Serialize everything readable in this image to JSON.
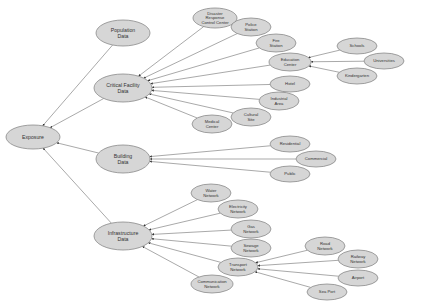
{
  "diagram": {
    "colors": {
      "node_fill": "#d6d6d6",
      "node_stroke": "#8a8a8a",
      "edge": "#6e6e6e",
      "text": "#333333"
    },
    "nodes": [
      {
        "id": "exposure",
        "lines": [
          "Exposure"
        ],
        "x": 33,
        "y": 137,
        "rx": 27,
        "ry": 12,
        "main": true
      },
      {
        "id": "population",
        "lines": [
          "Population",
          "Data"
        ],
        "x": 123,
        "y": 33,
        "rx": 27,
        "ry": 13,
        "main": true
      },
      {
        "id": "critical",
        "lines": [
          "Critical Facility",
          "Data"
        ],
        "x": 123,
        "y": 88,
        "rx": 29,
        "ry": 14,
        "main": true
      },
      {
        "id": "building",
        "lines": [
          "Building",
          "Data"
        ],
        "x": 123,
        "y": 159,
        "rx": 27,
        "ry": 14,
        "main": true
      },
      {
        "id": "infrastructure",
        "lines": [
          "Infrastructure",
          "Data"
        ],
        "x": 123,
        "y": 236,
        "rx": 29,
        "ry": 14,
        "main": true
      },
      {
        "id": "disaster",
        "lines": [
          "Disaster",
          "Response",
          "Control Center"
        ],
        "x": 215,
        "y": 18,
        "rx": 22,
        "ry": 10
      },
      {
        "id": "police",
        "lines": [
          "Police",
          "Station"
        ],
        "x": 251,
        "y": 27,
        "rx": 20,
        "ry": 9
      },
      {
        "id": "fire",
        "lines": [
          "Fire",
          "Station"
        ],
        "x": 276,
        "y": 43,
        "rx": 20,
        "ry": 9
      },
      {
        "id": "education",
        "lines": [
          "Education",
          "Center"
        ],
        "x": 290,
        "y": 62,
        "rx": 21,
        "ry": 9
      },
      {
        "id": "hotel",
        "lines": [
          "Hotel"
        ],
        "x": 290,
        "y": 84,
        "rx": 20,
        "ry": 8
      },
      {
        "id": "industrial",
        "lines": [
          "Industrial",
          "Area"
        ],
        "x": 279,
        "y": 101,
        "rx": 20,
        "ry": 9
      },
      {
        "id": "cultural",
        "lines": [
          "Cultural",
          "Site"
        ],
        "x": 251,
        "y": 117,
        "rx": 20,
        "ry": 9
      },
      {
        "id": "medical",
        "lines": [
          "Medical",
          "Center"
        ],
        "x": 212,
        "y": 124,
        "rx": 20,
        "ry": 9
      },
      {
        "id": "schools",
        "lines": [
          "Schools"
        ],
        "x": 357,
        "y": 46,
        "rx": 20,
        "ry": 8
      },
      {
        "id": "universities",
        "lines": [
          "Universities"
        ],
        "x": 384,
        "y": 61,
        "rx": 20,
        "ry": 8
      },
      {
        "id": "kindergarten",
        "lines": [
          "Kindergarten"
        ],
        "x": 357,
        "y": 76,
        "rx": 20,
        "ry": 8
      },
      {
        "id": "residential",
        "lines": [
          "Residential"
        ],
        "x": 290,
        "y": 144,
        "rx": 20,
        "ry": 8
      },
      {
        "id": "commercial",
        "lines": [
          "Commercial"
        ],
        "x": 316,
        "y": 159,
        "rx": 20,
        "ry": 8
      },
      {
        "id": "public",
        "lines": [
          "Public"
        ],
        "x": 290,
        "y": 174,
        "rx": 20,
        "ry": 8
      },
      {
        "id": "water",
        "lines": [
          "Water",
          "Network"
        ],
        "x": 211,
        "y": 193,
        "rx": 20,
        "ry": 9
      },
      {
        "id": "electricity",
        "lines": [
          "Electricity",
          "Network"
        ],
        "x": 238,
        "y": 209,
        "rx": 20,
        "ry": 9
      },
      {
        "id": "gas",
        "lines": [
          "Gas",
          "Network"
        ],
        "x": 251,
        "y": 229,
        "rx": 20,
        "ry": 9
      },
      {
        "id": "sewage",
        "lines": [
          "Sewage",
          "Network"
        ],
        "x": 251,
        "y": 248,
        "rx": 20,
        "ry": 9
      },
      {
        "id": "transport",
        "lines": [
          "Transport",
          "Network"
        ],
        "x": 238,
        "y": 267,
        "rx": 20,
        "ry": 9
      },
      {
        "id": "communication",
        "lines": [
          "Communication",
          "Network"
        ],
        "x": 212,
        "y": 284,
        "rx": 21,
        "ry": 9
      },
      {
        "id": "road",
        "lines": [
          "Road",
          "Network"
        ],
        "x": 325,
        "y": 246,
        "rx": 20,
        "ry": 9
      },
      {
        "id": "railway",
        "lines": [
          "Railway",
          "Network"
        ],
        "x": 358,
        "y": 259,
        "rx": 20,
        "ry": 9
      },
      {
        "id": "airport",
        "lines": [
          "Airport"
        ],
        "x": 358,
        "y": 278,
        "rx": 20,
        "ry": 8
      },
      {
        "id": "seaport",
        "lines": [
          "Sea Port"
        ],
        "x": 327,
        "y": 292,
        "rx": 20,
        "ry": 8
      }
    ],
    "edges": [
      [
        "population",
        "exposure"
      ],
      [
        "critical",
        "exposure"
      ],
      [
        "building",
        "exposure"
      ],
      [
        "infrastructure",
        "exposure"
      ],
      [
        "disaster",
        "critical"
      ],
      [
        "police",
        "critical"
      ],
      [
        "fire",
        "critical"
      ],
      [
        "education",
        "critical"
      ],
      [
        "hotel",
        "critical"
      ],
      [
        "industrial",
        "critical"
      ],
      [
        "cultural",
        "critical"
      ],
      [
        "medical",
        "critical"
      ],
      [
        "schools",
        "education"
      ],
      [
        "universities",
        "education"
      ],
      [
        "kindergarten",
        "education"
      ],
      [
        "residential",
        "building"
      ],
      [
        "commercial",
        "building"
      ],
      [
        "public",
        "building"
      ],
      [
        "water",
        "infrastructure"
      ],
      [
        "electricity",
        "infrastructure"
      ],
      [
        "gas",
        "infrastructure"
      ],
      [
        "sewage",
        "infrastructure"
      ],
      [
        "transport",
        "infrastructure"
      ],
      [
        "communication",
        "infrastructure"
      ],
      [
        "road",
        "transport"
      ],
      [
        "railway",
        "transport"
      ],
      [
        "airport",
        "transport"
      ],
      [
        "seaport",
        "transport"
      ]
    ]
  }
}
